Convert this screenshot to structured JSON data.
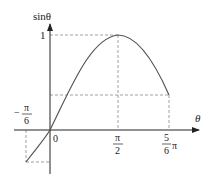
{
  "diagram": {
    "y_axis_label": "sinθ",
    "x_axis_label": "θ",
    "origin_label": "0",
    "y_tick_1": "1",
    "x_ticks": {
      "neg_pi_6": {
        "num": "π",
        "den": "6",
        "sign": "−"
      },
      "pi_2": {
        "num": "π",
        "den": "2"
      },
      "five_pi_6": {
        "num": "5",
        "den": "6",
        "suffix": "π"
      }
    },
    "colors": {
      "axis": "#222222",
      "curve": "#555555",
      "dash": "#888888"
    }
  }
}
